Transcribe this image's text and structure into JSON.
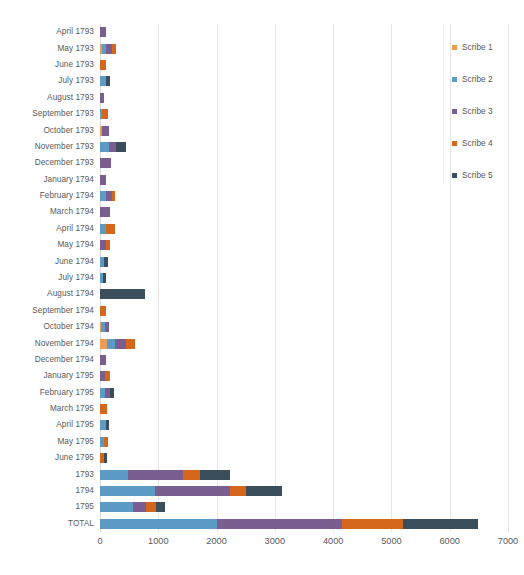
{
  "chart_data": {
    "type": "bar",
    "subtype": "stacked-horizontal",
    "title": "",
    "xlabel": "",
    "ylabel": "",
    "xlim": [
      0,
      7000
    ],
    "xticks": [
      0,
      1000,
      2000,
      3000,
      4000,
      5000,
      6000,
      7000
    ],
    "grid": "vertical",
    "legend_position": "right",
    "series": [
      {
        "name": "Scribe 1",
        "color": "#ED9C54",
        "values": [
          0,
          30,
          0,
          0,
          0,
          0,
          35,
          0,
          0,
          0,
          0,
          0,
          0,
          0,
          0,
          0,
          0,
          0,
          10,
          125,
          0,
          0,
          0,
          0,
          0,
          0,
          0,
          0,
          0,
          0,
          0
        ]
      },
      {
        "name": "Scribe 2",
        "color": "#5B9BC5",
        "values": [
          0,
          70,
          0,
          110,
          0,
          35,
          0,
          150,
          0,
          0,
          110,
          0,
          95,
          0,
          75,
          55,
          0,
          0,
          80,
          140,
          0,
          0,
          80,
          0,
          95,
          70,
          0,
          480,
          950,
          570,
          2000
        ]
      },
      {
        "name": "Scribe 3",
        "color": "#7B5E90",
        "values": [
          110,
          105,
          0,
          0,
          75,
          0,
          115,
          130,
          190,
          105,
          90,
          165,
          0,
          110,
          0,
          0,
          0,
          0,
          70,
          175,
          105,
          80,
          95,
          0,
          0,
          0,
          0,
          940,
          1280,
          220,
          2150
        ]
      },
      {
        "name": "Scribe 4",
        "color": "#D5671C",
        "values": [
          0,
          75,
          95,
          0,
          0,
          110,
          0,
          0,
          0,
          0,
          50,
          0,
          170,
          60,
          0,
          0,
          0,
          95,
          0,
          165,
          0,
          85,
          0,
          115,
          0,
          70,
          70,
          300,
          270,
          170,
          1050
        ]
      },
      {
        "name": "Scribe 5",
        "color": "#3B4E5C",
        "values": [
          0,
          0,
          0,
          60,
          0,
          0,
          0,
          170,
          0,
          0,
          0,
          0,
          0,
          0,
          65,
          50,
          770,
          0,
          0,
          0,
          0,
          0,
          60,
          0,
          60,
          0,
          55,
          510,
          630,
          160,
          1280
        ]
      }
    ],
    "categories": [
      "April 1793",
      "May 1793",
      "June 1793",
      "July 1793",
      "August 1793",
      "September 1793",
      "October 1793",
      "November 1793",
      "December 1793",
      "January 1794",
      "February 1794",
      "March 1794",
      "April 1794",
      "May 1794",
      "June 1794",
      "July 1794",
      "August 1794",
      "September 1794",
      "October 1794",
      "November 1794",
      "December 1794",
      "January 1795",
      "February 1795",
      "March 1795",
      "April 1795",
      "May 1795",
      "June 1795",
      "1793",
      "1794",
      "1795",
      "TOTAL"
    ],
    "totals": [
      110,
      280,
      95,
      170,
      75,
      145,
      150,
      450,
      190,
      105,
      250,
      165,
      265,
      170,
      140,
      105,
      770,
      95,
      160,
      605,
      105,
      165,
      235,
      115,
      155,
      140,
      125,
      2230,
      3130,
      1120,
      6480
    ]
  }
}
